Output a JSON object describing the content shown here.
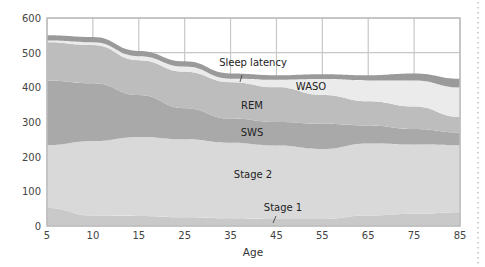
{
  "chart_data": {
    "type": "area",
    "stacked": true,
    "title": "",
    "xlabel": "Age",
    "ylabel": "",
    "x": [
      5,
      10,
      15,
      25,
      35,
      45,
      55,
      65,
      75,
      85
    ],
    "x_tick_labels": [
      "5",
      "10",
      "15",
      "25",
      "35",
      "45",
      "55",
      "65",
      "75",
      "85"
    ],
    "y_tick_labels": [
      "0",
      "100",
      "200",
      "300",
      "400",
      "500",
      "600"
    ],
    "ylim": [
      0,
      600
    ],
    "grid": true,
    "legend": "inline labels",
    "series": [
      {
        "name": "Stage 1",
        "values": [
          52,
          30,
          29,
          25,
          22,
          20,
          20,
          30,
          35,
          40
        ],
        "color": "#c9c9c9"
      },
      {
        "name": "Stage 2",
        "values": [
          181,
          215,
          228,
          225,
          218,
          212,
          202,
          208,
          200,
          193
        ],
        "color": "#d9d9d9"
      },
      {
        "name": "SWS",
        "values": [
          187,
          167,
          121,
          90,
          70,
          68,
          73,
          52,
          45,
          37
        ],
        "color": "#a9a9a9"
      },
      {
        "name": "REM",
        "values": [
          110,
          110,
          100,
          105,
          105,
          100,
          83,
          70,
          65,
          45
        ],
        "color": "#bdbdbd"
      },
      {
        "name": "WASO",
        "values": [
          5,
          8,
          12,
          15,
          10,
          22,
          46,
          60,
          75,
          85
        ],
        "color": "#ebebeb"
      },
      {
        "name": "Sleep latency",
        "values": [
          15,
          15,
          15,
          15,
          15,
          13,
          14,
          15,
          20,
          25
        ],
        "color": "#9a9a9a"
      }
    ],
    "cumulative_tops": {
      "Stage 1": [
        52,
        30,
        29,
        25,
        22,
        20,
        20,
        30,
        35,
        40
      ],
      "Stage 2": [
        233,
        245,
        257,
        250,
        240,
        232,
        222,
        238,
        235,
        233
      ],
      "SWS": [
        420,
        412,
        378,
        340,
        310,
        300,
        295,
        290,
        280,
        270
      ],
      "REM": [
        530,
        522,
        478,
        445,
        415,
        400,
        378,
        360,
        345,
        315
      ],
      "WASO": [
        535,
        530,
        490,
        460,
        425,
        422,
        424,
        420,
        420,
        400
      ],
      "Sleep latency": [
        550,
        545,
        505,
        475,
        440,
        435,
        438,
        435,
        440,
        425
      ]
    },
    "annotations": [
      {
        "text": "Sleep latency",
        "x": 40,
        "y": 470
      },
      {
        "text": "WASO",
        "x": 47,
        "y": 405
      },
      {
        "text": "REM",
        "x": 40,
        "y": 345
      },
      {
        "text": "SWS",
        "x": 40,
        "y": 268
      },
      {
        "text": "Stage 2",
        "x": 40,
        "y": 160
      },
      {
        "text": "Stage 1",
        "x": 47,
        "y": 60
      }
    ]
  },
  "colors": {
    "grid": "#c8c8c8",
    "frame": "#bdbdbd",
    "background": "#ffffff",
    "dotted_rule": "#d0d0d0"
  }
}
